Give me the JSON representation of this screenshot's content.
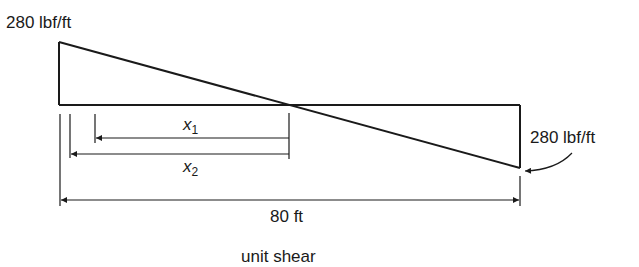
{
  "diagram": {
    "caption": "unit shear",
    "labels": {
      "left_load": "280 lbf/ft",
      "right_load": "280 lbf/ft",
      "span": "80 ft",
      "x1": "x",
      "x1_sub": "1",
      "x2": "x",
      "x2_sub": "2"
    },
    "geometry": {
      "left_top": [
        59,
        42
      ],
      "baseline_y": 105,
      "zero_crossing": [
        289,
        105
      ],
      "right_bottom": [
        520,
        168
      ],
      "right_edge_x": 520
    },
    "colors": {
      "line": "#1a1a1a",
      "background": "#ffffff"
    }
  }
}
